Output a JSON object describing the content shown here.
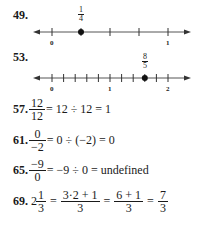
{
  "problems": [
    {
      "number": "49.",
      "type": "number_line",
      "point_label": {
        "numerator": "1",
        "denominator": "4"
      },
      "tick_labels": [
        "0",
        "1"
      ],
      "range": [
        0,
        1
      ],
      "tick_step": 0.25,
      "point_value": 0.25
    },
    {
      "number": "53.",
      "type": "number_line",
      "point_label": {
        "numerator": "8",
        "denominator": "5"
      },
      "tick_labels": [
        "0",
        "1",
        "2"
      ],
      "range": [
        0,
        2
      ],
      "tick_step": 0.2,
      "point_value": 1.6
    },
    {
      "number": "57.",
      "type": "equation",
      "frac": {
        "numerator": "12",
        "denominator": "12"
      },
      "rest": "= 12 ÷ 12 = 1"
    },
    {
      "number": "61.",
      "type": "equation",
      "frac": {
        "numerator": "0",
        "denominator": "−2"
      },
      "rest": "= 0 ÷ (−2) = 0"
    },
    {
      "number": "65.",
      "type": "equation",
      "frac": {
        "numerator": "−9",
        "denominator": "0"
      },
      "rest": "= −9 ÷ 0 = undefined"
    },
    {
      "number": "69.",
      "type": "equation",
      "whole": "2",
      "mixed_frac": {
        "numerator": "1",
        "denominator": "3"
      },
      "eq": "=",
      "step1": {
        "numerator": "3·2 + 1",
        "denominator": "3"
      },
      "step2": {
        "numerator": "6 + 1",
        "denominator": "3"
      },
      "result": {
        "numerator": "7",
        "denominator": "3"
      }
    }
  ]
}
